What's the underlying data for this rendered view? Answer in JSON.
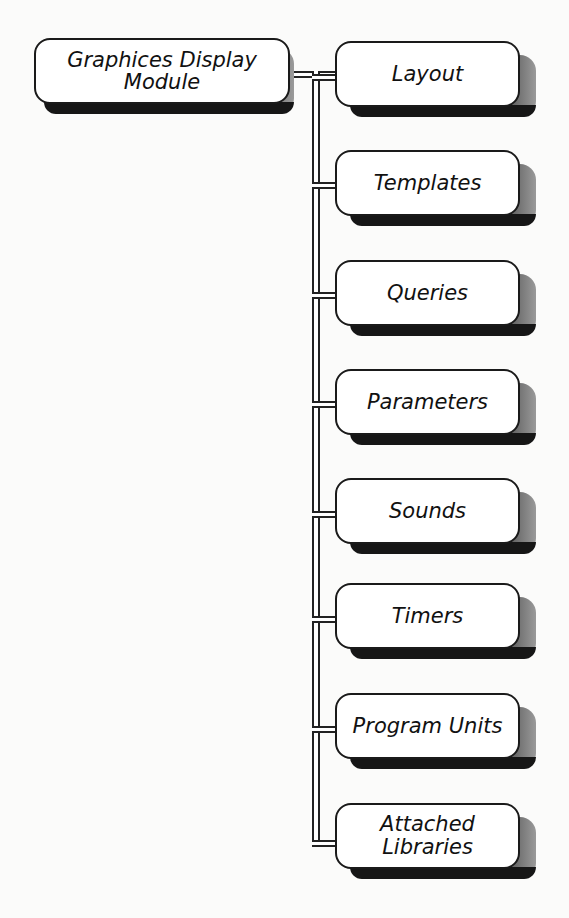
{
  "diagram": {
    "type": "tree",
    "root": {
      "label": "Graphices Display Module"
    },
    "children": [
      {
        "label": "Layout"
      },
      {
        "label": "Templates"
      },
      {
        "label": "Queries"
      },
      {
        "label": "Parameters"
      },
      {
        "label": "Sounds"
      },
      {
        "label": "Timers"
      },
      {
        "label": "Program Units"
      },
      {
        "label": "Attached Libraries"
      }
    ]
  }
}
